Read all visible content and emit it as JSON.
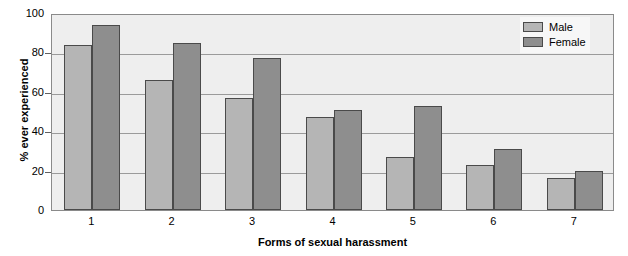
{
  "chart_data": {
    "type": "bar",
    "title": "",
    "subtitle": "",
    "xlabel": "Forms of sexual harassment",
    "ylabel": "% ever experienced",
    "categories": [
      "1",
      "2",
      "3",
      "4",
      "5",
      "6",
      "7"
    ],
    "series": [
      {
        "name": "Male",
        "values": [
          84,
          66,
          57,
          47,
          27,
          23,
          16
        ],
        "color": "#b5b5b5"
      },
      {
        "name": "Female",
        "values": [
          94,
          85,
          77,
          51,
          53,
          31,
          20
        ],
        "color": "#8e8e8e"
      }
    ],
    "ylim": [
      0,
      100
    ],
    "y_ticks": [
      0,
      20,
      40,
      60,
      80,
      100
    ],
    "y_tick_labels": [
      "0",
      "20",
      "40",
      "60",
      "80",
      "100"
    ],
    "grid": true,
    "grid_axis": "y",
    "legend_position": "top-right",
    "plot_background": "#eeeeee",
    "gridline_color": "#9a9a9a",
    "bar_outline_color": "#4a4a4a"
  },
  "legend": {
    "entries": [
      {
        "label": "Male"
      },
      {
        "label": "Female"
      }
    ]
  }
}
